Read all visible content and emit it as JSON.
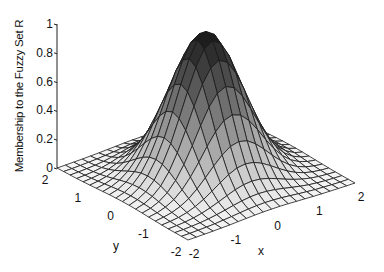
{
  "chart_data": {
    "type": "surface",
    "title": "",
    "xlabel": "x",
    "ylabel": "y",
    "zlabel": "Membership to the Fuzzy Set R",
    "function": "gaussian membership mu(x,y) = exp(-(x^2+y^2)/(2*sigma^2))",
    "sigma": 0.7,
    "xlim": [
      -2,
      2
    ],
    "ylim": [
      -2,
      2
    ],
    "zlim": [
      0,
      1
    ],
    "grid_divisions": 20,
    "x_ticks": [
      "-2",
      "-1",
      "0",
      "1",
      "2"
    ],
    "y_ticks": [
      "-2",
      "-1",
      "0",
      "1",
      "2"
    ],
    "z_ticks": [
      "0",
      "0.2",
      "0.4",
      "0.6",
      "0.8",
      "1"
    ],
    "peak": {
      "x": 0,
      "y": 0,
      "z": 1
    },
    "colormap": "gray (dark at peak, light at base)",
    "grid": false
  },
  "labels": {
    "z_axis": "Membership to the Fuzzy Set R",
    "x_axis": "x",
    "y_axis": "y"
  }
}
